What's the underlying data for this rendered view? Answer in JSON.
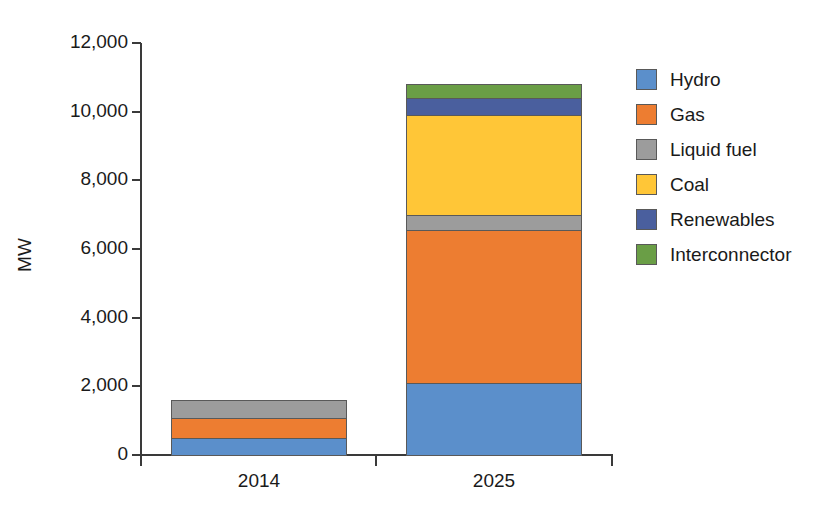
{
  "chart_data": {
    "type": "bar",
    "subtype": "stacked-bar",
    "title": "",
    "xlabel": "",
    "ylabel": "MW",
    "categories": [
      "2014",
      "2025"
    ],
    "ylim": [
      0,
      12000
    ],
    "yticks": [
      0,
      2000,
      4000,
      6000,
      8000,
      10000,
      12000
    ],
    "ytick_labels": [
      "0",
      "2,000",
      "4,000",
      "6,000",
      "8,000",
      "10,000",
      "12,000"
    ],
    "grid": false,
    "legend_position": "right",
    "series": [
      {
        "name": "Hydro",
        "color": "#5B8FCB",
        "values": [
          500,
          2100
        ]
      },
      {
        "name": "Gas",
        "color": "#ED7D31",
        "values": [
          580,
          4450
        ]
      },
      {
        "name": "Liquid fuel",
        "color": "#9C9C9C",
        "values": [
          520,
          450
        ]
      },
      {
        "name": "Coal",
        "color": "#FFC637",
        "values": [
          0,
          2900
        ]
      },
      {
        "name": "Renewables",
        "color": "#4A5F9E",
        "values": [
          0,
          500
        ]
      },
      {
        "name": "Interconnector",
        "color": "#6A9E46",
        "values": [
          0,
          400
        ]
      }
    ],
    "totals": [
      1600,
      10800
    ]
  },
  "legend": {
    "items": [
      {
        "label": "Hydro"
      },
      {
        "label": "Gas"
      },
      {
        "label": "Liquid fuel"
      },
      {
        "label": "Coal"
      },
      {
        "label": "Renewables"
      },
      {
        "label": "Interconnector"
      }
    ]
  }
}
